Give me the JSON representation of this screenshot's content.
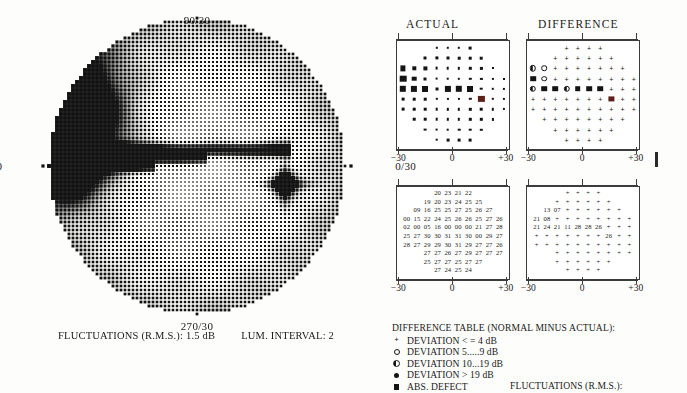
{
  "field_plot": {
    "meridian_labels": {
      "top": "90/30",
      "bottom": "270/30",
      "left": "180/30",
      "right": "0/30"
    }
  },
  "footer_left": {
    "fluctuations": "FLUCTUATIONS (R.M.S.): 1.5 dB",
    "lum_interval": "LUM. INTERVAL: 2"
  },
  "panels": {
    "actual_title": "ACTUAL",
    "difference_title": "DIFFERENCE"
  },
  "axis": {
    "left": "−30",
    "center": "0",
    "right": "+30"
  },
  "legend": {
    "header": "DIFFERENCE TABLE (NORMAL MINUS ACTUAL):",
    "items": [
      {
        "symbol": "plus",
        "text": "DEVIATION < = 4 dB"
      },
      {
        "symbol": "circle",
        "text": "DEVIATION 5.....9 dB"
      },
      {
        "symbol": "half",
        "text": "DEVIATION 10...19 dB"
      },
      {
        "symbol": "filled",
        "text": "DEVIATION > 19 dB"
      },
      {
        "symbol": "square",
        "text": "ABS. DEFECT"
      }
    ],
    "fluctuations_label": "FLUCTUATIONS (R.M.S.):"
  },
  "chart_data": [
    {
      "type": "heatmap",
      "title": "ACTUAL",
      "xlabel": "",
      "ylabel": "",
      "xlim": [
        -30,
        30
      ],
      "ylim": [
        -30,
        30
      ],
      "grid": false,
      "notes": "Symbol size encodes sensitivity loss: larger/darker square = lower sensitivity. Rows given top to bottom; each cell is [x_index, symbol, size] where symbol is 'sq' (black square) or 'blind' (dark red blind-spot marker). x_index 0..9 spans -27..+27 degrees.",
      "symbol_rows": [
        {
          "y": 27,
          "cells": [
            [
              3,
              "sq",
              2.4
            ],
            [
              4,
              "sq",
              2.4
            ],
            [
              5,
              "sq",
              2.4
            ],
            [
              6,
              "sq",
              2.8
            ]
          ]
        },
        {
          "y": 21,
          "cells": [
            [
              2,
              "sq",
              3.0
            ],
            [
              3,
              "sq",
              3.2
            ],
            [
              4,
              "sq",
              3.0
            ],
            [
              5,
              "sq",
              2.6
            ],
            [
              6,
              "sq",
              2.6
            ],
            [
              7,
              "sq",
              2.6
            ]
          ]
        },
        {
          "y": 15,
          "cells": [
            [
              0,
              "sq",
              5.2
            ],
            [
              1,
              "sq",
              3.4
            ],
            [
              2,
              "sq",
              3.2
            ],
            [
              3,
              "sq",
              2.8
            ],
            [
              4,
              "sq",
              2.6
            ],
            [
              5,
              "sq",
              2.4
            ],
            [
              6,
              "sq",
              2.4
            ],
            [
              7,
              "sq",
              2.2
            ],
            [
              8,
              "sq",
              2.0
            ]
          ]
        },
        {
          "y": 9,
          "cells": [
            [
              0,
              "sq",
              6.6
            ],
            [
              1,
              "sq",
              4.6
            ],
            [
              2,
              "sq",
              3.0
            ],
            [
              3,
              "sq",
              2.8
            ],
            [
              4,
              "sq",
              2.6
            ],
            [
              5,
              "sq",
              2.4
            ],
            [
              6,
              "sq",
              2.4
            ],
            [
              7,
              "sq",
              2.2
            ],
            [
              8,
              "sq",
              2.2
            ],
            [
              9,
              "sq",
              2.0
            ]
          ]
        },
        {
          "y": 3,
          "cells": [
            [
              0,
              "sq",
              6.4
            ],
            [
              1,
              "sq",
              6.2
            ],
            [
              2,
              "sq",
              6.0
            ],
            [
              3,
              "sq",
              3.0
            ],
            [
              4,
              "sq",
              6.2
            ],
            [
              5,
              "sq",
              6.4
            ],
            [
              6,
              "sq",
              6.0
            ],
            [
              7,
              "sq",
              2.6
            ],
            [
              8,
              "sq",
              2.4
            ],
            [
              9,
              "sq",
              2.2
            ]
          ]
        },
        {
          "y": -3,
          "cells": [
            [
              0,
              "sq",
              2.8
            ],
            [
              1,
              "sq",
              2.6
            ],
            [
              2,
              "sq",
              2.6
            ],
            [
              3,
              "sq",
              2.4
            ],
            [
              4,
              "sq",
              2.2
            ],
            [
              5,
              "sq",
              2.2
            ],
            [
              6,
              "sq",
              2.4
            ],
            [
              7,
              "blind",
              6.2
            ],
            [
              8,
              "sq",
              2.4
            ],
            [
              9,
              "sq",
              2.2
            ]
          ]
        },
        {
          "y": -9,
          "cells": [
            [
              0,
              "sq",
              2.8
            ],
            [
              1,
              "sq",
              2.6
            ],
            [
              2,
              "sq",
              2.6
            ],
            [
              3,
              "sq",
              2.6
            ],
            [
              4,
              "sq",
              2.4
            ],
            [
              5,
              "sq",
              2.4
            ],
            [
              6,
              "sq",
              2.4
            ],
            [
              7,
              "sq",
              2.6
            ],
            [
              8,
              "sq",
              2.4
            ],
            [
              9,
              "sq",
              2.2
            ]
          ]
        },
        {
          "y": -15,
          "cells": [
            [
              1,
              "sq",
              2.6
            ],
            [
              2,
              "sq",
              2.6
            ],
            [
              3,
              "sq",
              2.6
            ],
            [
              4,
              "sq",
              2.4
            ],
            [
              5,
              "sq",
              2.4
            ],
            [
              6,
              "sq",
              2.4
            ],
            [
              7,
              "sq",
              2.4
            ],
            [
              8,
              "sq",
              2.2
            ]
          ]
        },
        {
          "y": -21,
          "cells": [
            [
              2,
              "sq",
              2.8
            ],
            [
              3,
              "sq",
              2.8
            ],
            [
              4,
              "sq",
              2.6
            ],
            [
              5,
              "sq",
              2.6
            ],
            [
              6,
              "sq",
              2.6
            ],
            [
              7,
              "sq",
              2.4
            ]
          ]
        },
        {
          "y": -27,
          "cells": [
            [
              3,
              "sq",
              2.6
            ],
            [
              4,
              "sq",
              2.8
            ],
            [
              5,
              "sq",
              2.8
            ],
            [
              6,
              "sq",
              2.8
            ]
          ]
        }
      ]
    },
    {
      "type": "heatmap",
      "title": "DIFFERENCE",
      "xlabel": "",
      "ylabel": "",
      "xlim": [
        -30,
        30
      ],
      "ylim": [
        -30,
        30
      ],
      "grid": false,
      "notes": "Deviation symbols: '+' <=4 dB, 'o' 5-9 dB, 'h' half-filled 10-19 dB, 'f' filled >19 dB, 's' absolute defect, 'blind' physiological blind spot.",
      "symbol_rows": [
        {
          "y": 27,
          "cells": [
            [
              3,
              "+"
            ],
            [
              4,
              "+"
            ],
            [
              5,
              "+"
            ],
            [
              6,
              "+"
            ]
          ]
        },
        {
          "y": 21,
          "cells": [
            [
              2,
              "+"
            ],
            [
              3,
              "+"
            ],
            [
              4,
              "+"
            ],
            [
              5,
              "+"
            ],
            [
              6,
              "+"
            ],
            [
              7,
              "+"
            ]
          ]
        },
        {
          "y": 15,
          "cells": [
            [
              0,
              "h"
            ],
            [
              1,
              "o"
            ],
            [
              2,
              "+"
            ],
            [
              3,
              "+"
            ],
            [
              4,
              "+"
            ],
            [
              5,
              "+"
            ],
            [
              6,
              "+"
            ],
            [
              7,
              "+"
            ],
            [
              8,
              "+"
            ]
          ]
        },
        {
          "y": 9,
          "cells": [
            [
              0,
              "s"
            ],
            [
              1,
              "o"
            ],
            [
              2,
              "+"
            ],
            [
              3,
              "+"
            ],
            [
              4,
              "+"
            ],
            [
              5,
              "+"
            ],
            [
              6,
              "+"
            ],
            [
              7,
              "+"
            ],
            [
              8,
              "+"
            ],
            [
              9,
              "+"
            ]
          ]
        },
        {
          "y": 3,
          "cells": [
            [
              0,
              "h"
            ],
            [
              1,
              "s"
            ],
            [
              2,
              "s"
            ],
            [
              3,
              "h"
            ],
            [
              4,
              "s"
            ],
            [
              5,
              "s"
            ],
            [
              6,
              "s"
            ],
            [
              7,
              "+"
            ],
            [
              8,
              "+"
            ],
            [
              9,
              "+"
            ]
          ]
        },
        {
          "y": -3,
          "cells": [
            [
              0,
              "+"
            ],
            [
              1,
              "+"
            ],
            [
              2,
              "+"
            ],
            [
              3,
              "+"
            ],
            [
              4,
              "+"
            ],
            [
              5,
              "+"
            ],
            [
              6,
              "+"
            ],
            [
              7,
              "blind"
            ],
            [
              8,
              "+"
            ],
            [
              9,
              "+"
            ]
          ]
        },
        {
          "y": -9,
          "cells": [
            [
              0,
              "+"
            ],
            [
              1,
              "+"
            ],
            [
              2,
              "+"
            ],
            [
              3,
              "+"
            ],
            [
              4,
              "+"
            ],
            [
              5,
              "+"
            ],
            [
              6,
              "+"
            ],
            [
              7,
              "+"
            ],
            [
              8,
              "+"
            ],
            [
              9,
              "+"
            ]
          ]
        },
        {
          "y": -15,
          "cells": [
            [
              1,
              "+"
            ],
            [
              2,
              "+"
            ],
            [
              3,
              "+"
            ],
            [
              4,
              "+"
            ],
            [
              5,
              "+"
            ],
            [
              6,
              "+"
            ],
            [
              7,
              "+"
            ],
            [
              8,
              "+"
            ]
          ]
        },
        {
          "y": -21,
          "cells": [
            [
              2,
              "+"
            ],
            [
              3,
              "+"
            ],
            [
              4,
              "+"
            ],
            [
              5,
              "+"
            ],
            [
              6,
              "+"
            ],
            [
              7,
              "+"
            ]
          ]
        },
        {
          "y": -27,
          "cells": [
            [
              3,
              "+"
            ],
            [
              4,
              "+"
            ],
            [
              5,
              "+"
            ],
            [
              6,
              "+"
            ]
          ]
        }
      ]
    },
    {
      "type": "table",
      "title": "ACTUAL numeric table (dB)",
      "xlim": [
        -30,
        30
      ],
      "rows": [
        [
          "",
          "",
          "",
          "20",
          "23",
          "21",
          "22",
          "",
          "",
          ""
        ],
        [
          "",
          "",
          "19",
          "20",
          "23",
          "24",
          "25",
          "25",
          "",
          ""
        ],
        [
          "",
          "09",
          "16",
          "25",
          "25",
          "27",
          "25",
          "26",
          "27",
          ""
        ],
        [
          "00",
          "15",
          "22",
          "24",
          "25",
          "26",
          "26",
          "25",
          "27",
          "26"
        ],
        [
          "02",
          "00",
          "05",
          "16",
          "00",
          "00",
          "00",
          "21",
          "27",
          "28"
        ],
        [
          "25",
          "27",
          "30",
          "30",
          "31",
          "31",
          "30",
          "00",
          "29",
          "27"
        ],
        [
          "28",
          "27",
          "29",
          "29",
          "30",
          "31",
          "29",
          "27",
          "27",
          "26"
        ],
        [
          "",
          "",
          "27",
          "27",
          "26",
          "27",
          "29",
          "27",
          "27",
          "27"
        ],
        [
          "",
          "",
          "25",
          "27",
          "27",
          "25",
          "27",
          "27",
          "",
          ""
        ],
        [
          "",
          "",
          "",
          "27",
          "24",
          "25",
          "24",
          "",
          "",
          ""
        ]
      ]
    },
    {
      "type": "table",
      "title": "DIFFERENCE numeric table",
      "xlim": [
        -30,
        30
      ],
      "rows": [
        [
          "",
          "",
          "",
          "+",
          "+",
          "+",
          "+",
          "",
          "",
          ""
        ],
        [
          "",
          "",
          "+",
          "+",
          "+",
          "+",
          "+",
          "+",
          "",
          ""
        ],
        [
          "",
          "13",
          "07",
          "+",
          "+",
          "+",
          "+",
          "+",
          "+",
          ""
        ],
        [
          "21",
          "08",
          "+",
          "+",
          "+",
          "+",
          "+",
          "+",
          "+",
          "+"
        ],
        [
          "21",
          "24",
          "21",
          "11",
          "28",
          "28",
          "26",
          "+",
          "+",
          "+"
        ],
        [
          "+",
          "+",
          "+",
          "+",
          "+",
          "+",
          "+",
          "26",
          "+",
          "+"
        ],
        [
          "+",
          "+",
          "+",
          "+",
          "+",
          "+",
          "+",
          "+",
          "+",
          "+"
        ],
        [
          "",
          "",
          "+",
          "+",
          "+",
          "+",
          "+",
          "+",
          "+",
          "+"
        ],
        [
          "",
          "",
          "+",
          "+",
          "+",
          "+",
          "+",
          "+",
          "",
          ""
        ],
        [
          "",
          "",
          "",
          "+",
          "+",
          "+",
          "+",
          "",
          "",
          ""
        ]
      ]
    }
  ]
}
